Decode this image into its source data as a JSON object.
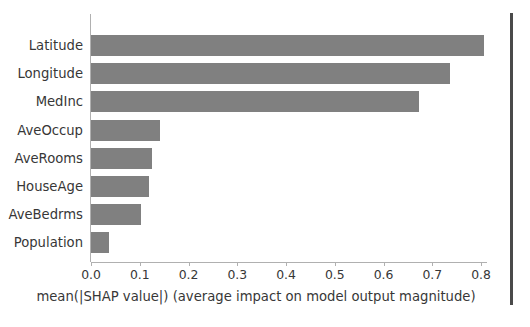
{
  "chart_data": {
    "type": "bar",
    "orientation": "horizontal",
    "title": "",
    "xlabel": "mean(|SHAP value|) (average impact on model output magnitude)",
    "ylabel": "",
    "categories": [
      "Latitude",
      "Longitude",
      "MedInc",
      "AveOccup",
      "AveRooms",
      "HouseAge",
      "AveBedrms",
      "Population"
    ],
    "values": [
      0.806,
      0.736,
      0.673,
      0.142,
      0.125,
      0.118,
      0.103,
      0.037
    ],
    "xlim": [
      0.0,
      0.82
    ],
    "xticks": [
      "0.0",
      "0.1",
      "0.2",
      "0.3",
      "0.4",
      "0.5",
      "0.6",
      "0.7",
      "0.8"
    ],
    "xtick_values": [
      0.0,
      0.1,
      0.2,
      0.3,
      0.4,
      0.5,
      0.6,
      0.7,
      0.8
    ],
    "grid": false,
    "legend": null,
    "bar_color": "#808080",
    "axis_color": "#b0b0b0",
    "text_color": "#373737",
    "background": "#ffffff"
  }
}
